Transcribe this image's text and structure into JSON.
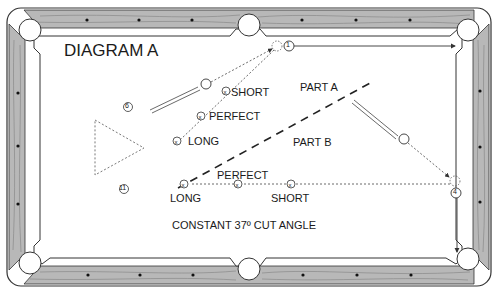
{
  "diagram": {
    "title": "DIAGRAM A",
    "caption": "CONSTANT 37º CUT ANGLE",
    "regions": {
      "part_a": "PART A",
      "part_b": "PART B"
    },
    "upper_shot": {
      "object_ball": "1",
      "positions": {
        "short": "SHORT",
        "perfect": "PERFECT",
        "long": "LONG"
      }
    },
    "lower_shot": {
      "object_ball": "4",
      "positions": {
        "perfect": "PERFECT",
        "long": "LONG",
        "short": "SHORT"
      }
    },
    "other_balls": [
      "6",
      "11"
    ],
    "colors": {
      "rail_wood": "#b5b5b5",
      "outline": "#333333",
      "cloth": "#ffffff"
    }
  }
}
